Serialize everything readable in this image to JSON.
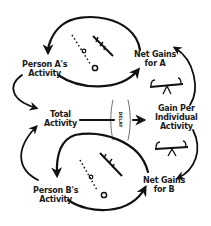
{
  "diagram": {
    "type": "causal-loop",
    "nodes": [
      {
        "id": "person_a",
        "label_line1": "Person A's",
        "label_line2": "Activity"
      },
      {
        "id": "net_gains_a",
        "label_line1": "Net Gains",
        "label_line2": "for A"
      },
      {
        "id": "total",
        "label_line1": "Total",
        "label_line2": "Activity"
      },
      {
        "id": "gain_per",
        "label_line1": "Gain Per",
        "label_line2": "Individual",
        "label_line3": "Activity"
      },
      {
        "id": "person_b",
        "label_line1": "Person B's",
        "label_line2": "Activity"
      },
      {
        "id": "net_gains_b",
        "label_line1": "Net Gains",
        "label_line2": "for B"
      }
    ],
    "delay_label": "DELAY",
    "edges": [
      {
        "from": "person_a",
        "to": "net_gains_a"
      },
      {
        "from": "net_gains_a",
        "to": "person_a"
      },
      {
        "from": "person_a",
        "to": "total"
      },
      {
        "from": "total",
        "to": "gain_per",
        "delay": true
      },
      {
        "from": "gain_per",
        "to": "net_gains_a"
      },
      {
        "from": "gain_per",
        "to": "net_gains_b"
      },
      {
        "from": "person_b",
        "to": "total"
      },
      {
        "from": "person_b",
        "to": "net_gains_b"
      },
      {
        "from": "net_gains_b",
        "to": "person_b"
      }
    ],
    "loop_symbols": [
      "reinforcing-loop-A",
      "balance-seesaw-top",
      "balance-seesaw-bottom",
      "reinforcing-loop-B"
    ]
  }
}
